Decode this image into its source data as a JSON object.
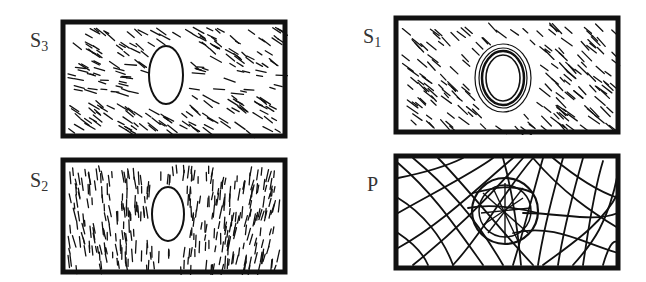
{
  "figure": {
    "panels": [
      {
        "id": "S3",
        "label_main": "S",
        "label_sub": "3",
        "description": "Layer with oblique/horizontal fibrils around an elliptical pit opening"
      },
      {
        "id": "S1",
        "label_main": "S",
        "label_sub": "1",
        "description": "Layer with oblique fibrils around a pit with concentric rings"
      },
      {
        "id": "S2",
        "label_main": "S",
        "label_sub": "2",
        "description": "Layer with near-vertical fibrils deflecting around an elliptical pit opening"
      },
      {
        "id": "P",
        "label_main": "P",
        "label_sub": "",
        "description": "Primary wall with random fibril network and circular pit field"
      }
    ]
  },
  "colors": {
    "ink": "#111111",
    "label": "#333333",
    "background": "#ffffff"
  }
}
